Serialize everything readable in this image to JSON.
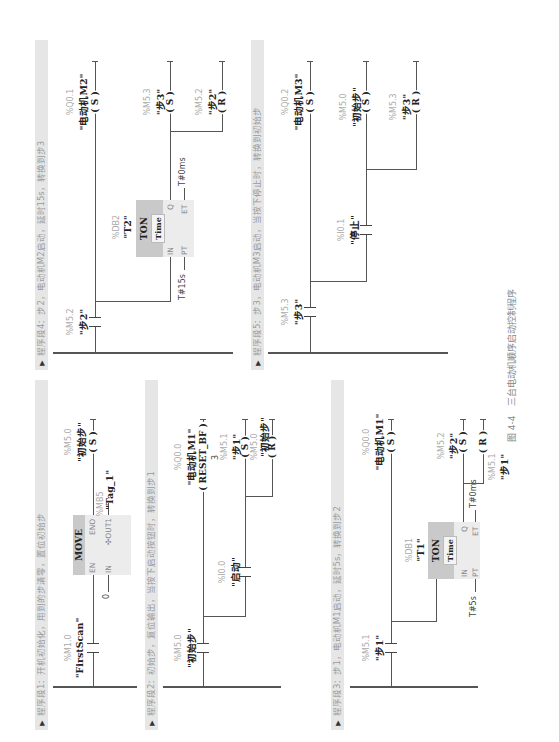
{
  "figure": {
    "caption": "图 4-4　三台电动机顺序启动控制程序",
    "rotation": "page rotated 90° counter-clockwise"
  },
  "segments": [
    {
      "header": "程序段1：开机初始化，用到的步清零，置位初始步",
      "contact": {
        "addr": "%M1.0",
        "name": "\"FirstScan\""
      },
      "move_box": {
        "title": "MOVE",
        "en": "EN",
        "eno": "ENO",
        "in": "IN",
        "out": "OUT1",
        "in_value": "0",
        "out_addr": "%MB5",
        "out_name": "\"Tag_1\""
      },
      "coil": {
        "addr": "%M5.0",
        "name": "\"初始步\"",
        "type": "S"
      }
    },
    {
      "header": "程序段2：初始步，复位输出，当按下启动按钮时，转换到步1",
      "contact1": {
        "addr": "%M5.0",
        "name": "\"初始步\""
      },
      "contact2": {
        "addr": "%I0.0",
        "name": "\"启动\""
      },
      "coil_reset_bf": {
        "addr": "%Q0.0",
        "name": "\"电动机M1\"",
        "type": "RESET_BF",
        "count": "3"
      },
      "coil_s": {
        "addr": "%M5.1",
        "name": "\"步1\"",
        "type": "S"
      },
      "coil_r": {
        "addr": "%M5.0",
        "name": "\"初始步\"",
        "type": "R"
      }
    },
    {
      "header": "程序段3：步1，电动机M1启动，延时5s，转换到步2",
      "contact": {
        "addr": "%M5.1",
        "name": "\"步1\""
      },
      "timer": {
        "db": "%DB1",
        "name": "\"T1\"",
        "type": "TON",
        "sub": "Time",
        "in": "IN",
        "q": "Q",
        "pt": "PT",
        "et": "ET",
        "pt_value": "T#5s",
        "et_value": "T#0ms"
      },
      "coil_motor": {
        "addr": "%Q0.0",
        "name": "\"电动机M1\"",
        "type": "S"
      },
      "coil_s": {
        "addr": "%M5.2",
        "name": "\"步2\"",
        "type": "S"
      },
      "coil_r": {
        "addr": "%M5.1",
        "name": "\"步1\"",
        "type": "R"
      }
    },
    {
      "header": "程序段4：步2，电动机M2启动，延时15s，转换到步3",
      "contact": {
        "addr": "%M5.2",
        "name": "\"步2\""
      },
      "timer": {
        "db": "%DB2",
        "name": "\"T2\"",
        "type": "TON",
        "sub": "Time",
        "in": "IN",
        "q": "Q",
        "pt": "PT",
        "et": "ET",
        "pt_value": "T#15s",
        "et_value": "T#0ms"
      },
      "coil_motor": {
        "addr": "%Q0.1",
        "name": "\"电动机M2\"",
        "type": "S"
      },
      "coil_s": {
        "addr": "%M5.3",
        "name": "\"步3\"",
        "type": "S"
      },
      "coil_r": {
        "addr": "%M5.2",
        "name": "\"步2\"",
        "type": "R"
      }
    },
    {
      "header": "程序段5：步3，电动机M3启动，当按下停止时，转换到初始步",
      "contact": {
        "addr": "%M5.3",
        "name": "\"步3\""
      },
      "contact_stop": {
        "addr": "%I0.1",
        "name": "\"停止\""
      },
      "coil_motor": {
        "addr": "%Q0.2",
        "name": "\"电动机M3\"",
        "type": "S"
      },
      "coil_s": {
        "addr": "%M5.0",
        "name": "\"初始步\"",
        "type": "S"
      },
      "coil_r": {
        "addr": "%M5.3",
        "name": "\"步3\"",
        "type": "R"
      }
    }
  ]
}
